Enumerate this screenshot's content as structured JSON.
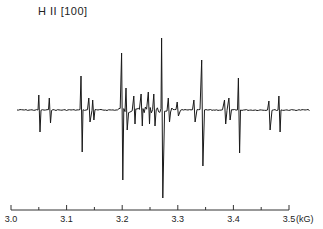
{
  "chart_data": {
    "type": "line",
    "title": "H II [100]",
    "xlabel": "(kG)",
    "ylabel": "",
    "xlim": [
      3.0,
      3.5
    ],
    "x_ticks": [
      "3.0",
      "3.1",
      "3.2",
      "3.3",
      "3.4",
      "3.5"
    ],
    "x_unit": "(kG)",
    "grid": false,
    "legend": null,
    "series": [
      {
        "name": "ESR derivative signal",
        "lines": [
          {
            "field_kG": 3.051,
            "amplitude_up": 15,
            "amplitude_down": 22
          },
          {
            "field_kG": 3.07,
            "amplitude_up": 12,
            "amplitude_down": 13
          },
          {
            "field_kG": 3.127,
            "amplitude_up": 34,
            "amplitude_down": 42
          },
          {
            "field_kG": 3.141,
            "amplitude_up": 12,
            "amplitude_down": 12
          },
          {
            "field_kG": 3.148,
            "amplitude_up": 10,
            "amplitude_down": 10
          },
          {
            "field_kG": 3.2,
            "amplitude_up": 57,
            "amplitude_down": 70
          },
          {
            "field_kG": 3.208,
            "amplitude_up": 22,
            "amplitude_down": 20
          },
          {
            "field_kG": 3.222,
            "amplitude_up": 14,
            "amplitude_down": 14
          },
          {
            "field_kG": 3.235,
            "amplitude_up": 16,
            "amplitude_down": 16
          },
          {
            "field_kG": 3.248,
            "amplitude_up": 18,
            "amplitude_down": 14
          },
          {
            "field_kG": 3.258,
            "amplitude_up": 16,
            "amplitude_down": 16
          },
          {
            "field_kG": 3.272,
            "amplitude_up": 72,
            "amplitude_down": 88
          },
          {
            "field_kG": 3.284,
            "amplitude_up": 12,
            "amplitude_down": 12
          },
          {
            "field_kG": 3.3,
            "amplitude_up": 8,
            "amplitude_down": 6
          },
          {
            "field_kG": 3.33,
            "amplitude_up": 10,
            "amplitude_down": 12
          },
          {
            "field_kG": 3.344,
            "amplitude_up": 50,
            "amplitude_down": 56
          },
          {
            "field_kG": 3.385,
            "amplitude_up": 10,
            "amplitude_down": 14
          },
          {
            "field_kG": 3.393,
            "amplitude_up": 12,
            "amplitude_down": 10
          },
          {
            "field_kG": 3.41,
            "amplitude_up": 32,
            "amplitude_down": 43
          },
          {
            "field_kG": 3.465,
            "amplitude_up": 9,
            "amplitude_down": 20
          },
          {
            "field_kG": 3.483,
            "amplitude_up": 14,
            "amplitude_down": 22
          }
        ]
      }
    ]
  }
}
